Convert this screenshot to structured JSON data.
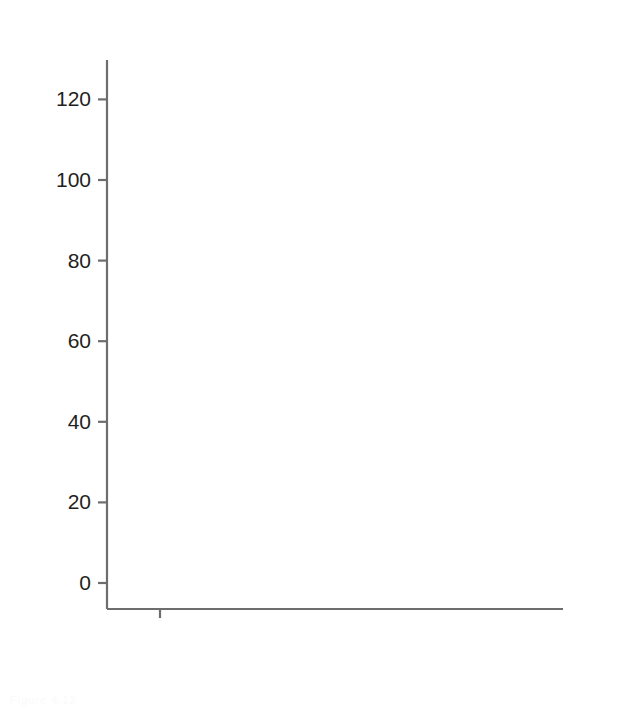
{
  "chart_data": {
    "type": "box",
    "title": "",
    "xlabel": "Hard coral cover rating",
    "ylabel": "Richness",
    "categories": [
      "0",
      "1",
      "2",
      "3",
      "4",
      "5"
    ],
    "xlim": [
      -0.6,
      5.6
    ],
    "ylim": [
      -6,
      133
    ],
    "yticks": [
      0,
      20,
      40,
      60,
      80,
      100,
      120
    ],
    "ytick_labels": [
      "0",
      "20",
      "40",
      "60",
      "80",
      "100",
      "120"
    ],
    "xticks": [
      0,
      1,
      2,
      3,
      4,
      5
    ],
    "grid": false,
    "legend": "none",
    "box_color": "#ffffff",
    "box_edge_color": "#9a9a9a",
    "median_color": "#8c8c8c",
    "whisker_color": "#9a9a9a",
    "outlier_color": "#9a9a9a",
    "axis_color": "#6d6d6d",
    "boxes": [
      {
        "category": "0",
        "min": 0,
        "q1": 0,
        "median": 0,
        "q3": 0,
        "max": 0,
        "outliers": [],
        "degenerate": true
      },
      {
        "category": "1",
        "min": 2,
        "q1": 17.5,
        "median": 32,
        "q3": 44,
        "max": 83,
        "outliers": [
          92
        ]
      },
      {
        "category": "2",
        "min": 8,
        "q1": 25,
        "median": 36.5,
        "q3": 51.5,
        "max": 88,
        "outliers": [
          128,
          104.5,
          96,
          93.5,
          92
        ]
      },
      {
        "category": "3",
        "min": 5,
        "q1": 26,
        "median": 41,
        "q3": 60,
        "max": 107,
        "outliers": [
          118.5
        ]
      },
      {
        "category": "4",
        "min": 11,
        "q1": 31.5,
        "median": 47,
        "q3": 65,
        "max": 111,
        "outliers": []
      },
      {
        "category": "5",
        "min": 6,
        "q1": 17,
        "median": 32.5,
        "q3": 59,
        "max": 92,
        "outliers": []
      }
    ]
  },
  "figure": {
    "y_axis_title": "Richness",
    "x_axis_title": "Hard coral cover rating",
    "y_tick_labels": [
      "120",
      "100",
      "80",
      "60",
      "40",
      "20",
      "0"
    ],
    "x_tick_labels": [
      "0",
      "1",
      "2",
      "3",
      "4",
      "5"
    ],
    "caption_fragment": "Figure 4.12"
  }
}
